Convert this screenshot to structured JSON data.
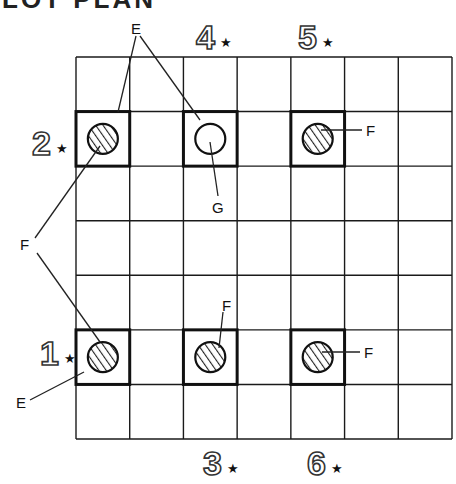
{
  "title_partial": "LOT PLAN",
  "grid": {
    "columns": 7,
    "rows": 7,
    "left": 76,
    "top": 57,
    "right": 452,
    "bottom": 439,
    "line_color": "#1a1a1a"
  },
  "lots": [
    {
      "id": "2",
      "col": 0,
      "row": 1,
      "fill": "hatched"
    },
    {
      "id": "4",
      "col": 2,
      "row": 1,
      "fill": "open"
    },
    {
      "id": "5",
      "col": 4,
      "row": 1,
      "fill": "hatched"
    },
    {
      "id": "1",
      "col": 0,
      "row": 5,
      "fill": "hatched"
    },
    {
      "id": "3",
      "col": 2,
      "row": 5,
      "fill": "hatched"
    },
    {
      "id": "6",
      "col": 4,
      "row": 5,
      "fill": "hatched"
    }
  ],
  "markers": [
    {
      "number": "4",
      "star": "★",
      "x": 196,
      "y": 20
    },
    {
      "number": "5",
      "star": "★",
      "x": 298,
      "y": 20
    },
    {
      "number": "2",
      "star": "★",
      "x": 32,
      "y": 126
    },
    {
      "number": "1",
      "star": "★",
      "x": 40,
      "y": 336
    },
    {
      "number": "3",
      "star": "★",
      "x": 203,
      "y": 446
    },
    {
      "number": "6",
      "star": "★",
      "x": 307,
      "y": 446
    }
  ],
  "labels": {
    "e_top": "E",
    "f_left": "F",
    "e_bottom": "E",
    "g": "G",
    "f_right_top": "F",
    "f_mid_bottom": "F",
    "f_right_bottom": "F"
  }
}
